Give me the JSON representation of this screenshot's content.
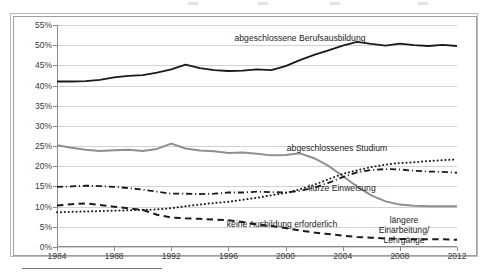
{
  "chart_data": {
    "type": "line",
    "title": "",
    "subtitle": "",
    "xlabel": "",
    "ylabel": "",
    "xlim": [
      1984,
      2012
    ],
    "ylim": [
      0,
      55
    ],
    "ytick_labels": [
      "0%",
      "5%",
      "10%",
      "15%",
      "20%",
      "25%",
      "30%",
      "35%",
      "40%",
      "45%",
      "50%",
      "55%"
    ],
    "ytick_values": [
      0,
      5,
      10,
      15,
      20,
      25,
      30,
      35,
      40,
      45,
      50,
      55
    ],
    "xtick_labels": [
      "1984",
      "1988",
      "1992",
      "1996",
      "2000",
      "2004",
      "2008",
      "2012"
    ],
    "xtick_values": [
      1984,
      1988,
      1992,
      1996,
      2000,
      2004,
      2008,
      2012
    ],
    "grid": true,
    "legend_position": "inline-annotations",
    "x": [
      1984,
      1985,
      1986,
      1987,
      1988,
      1989,
      1990,
      1991,
      1992,
      1993,
      1994,
      1995,
      1996,
      1997,
      1998,
      1999,
      2000,
      2001,
      2002,
      2003,
      2004,
      2005,
      2006,
      2007,
      2008,
      2009,
      2010,
      2011,
      2012
    ],
    "series": [
      {
        "name": "abgeschlossene Berufsausbildung",
        "style": "solid",
        "color": "#1a1a1a",
        "width": 1.8,
        "values": [
          41.0,
          41.0,
          41.1,
          41.4,
          42.0,
          42.4,
          42.6,
          43.2,
          44.0,
          45.2,
          44.3,
          43.8,
          43.6,
          43.7,
          44.0,
          43.8,
          44.8,
          46.3,
          47.6,
          48.7,
          49.9,
          50.8,
          50.3,
          49.9,
          50.4,
          50.0,
          49.8,
          50.1,
          49.8
        ]
      },
      {
        "name": "längere Einarbeitung/ Lehrgänge",
        "style": "solid",
        "color": "#8f8f8f",
        "width": 2.0,
        "values": [
          25.2,
          24.6,
          24.1,
          23.8,
          24.0,
          24.1,
          23.8,
          24.3,
          25.6,
          24.4,
          23.9,
          23.7,
          23.3,
          23.4,
          23.1,
          22.7,
          22.8,
          23.2,
          22.0,
          20.1,
          17.6,
          15.0,
          12.8,
          11.3,
          10.5,
          10.2,
          10.1,
          10.1,
          10.1
        ]
      },
      {
        "name": "kurze Einweisung",
        "style": "dashdot",
        "color": "#1a1a1a",
        "width": 1.8,
        "values": [
          14.9,
          15.0,
          15.2,
          15.1,
          14.9,
          14.6,
          14.2,
          13.7,
          13.2,
          13.2,
          13.1,
          13.2,
          13.5,
          13.5,
          13.7,
          13.6,
          13.5,
          13.9,
          14.7,
          15.9,
          17.3,
          18.5,
          19.1,
          19.3,
          19.2,
          18.9,
          18.7,
          18.6,
          18.4
        ]
      },
      {
        "name": "abgeschlossenes Studium",
        "style": "dotted",
        "color": "#1a1a1a",
        "width": 2.0,
        "values": [
          8.6,
          8.7,
          8.8,
          8.9,
          9.0,
          9.1,
          9.2,
          9.3,
          9.6,
          10.1,
          10.5,
          10.9,
          11.2,
          11.7,
          12.2,
          12.8,
          13.4,
          14.3,
          15.4,
          16.8,
          18.1,
          19.0,
          19.8,
          20.4,
          20.8,
          21.0,
          21.3,
          21.5,
          21.7
        ]
      },
      {
        "name": "keine Ausbildung erforderlich",
        "style": "dashed",
        "color": "#1a1a1a",
        "width": 2.0,
        "values": [
          10.3,
          10.6,
          10.8,
          10.4,
          10.0,
          9.6,
          9.2,
          8.0,
          7.3,
          7.1,
          7.0,
          6.8,
          6.6,
          6.2,
          5.6,
          5.2,
          4.7,
          4.1,
          3.6,
          3.2,
          2.8,
          2.5,
          2.3,
          2.1,
          2.0,
          1.9,
          1.9,
          1.9,
          1.8
        ]
      }
    ],
    "annotations": [
      {
        "text": "abgeschlossene Berufsausbildung",
        "x_px": 300,
        "y_px": 33,
        "lines": 1
      },
      {
        "text": "abgeschlossenes Studium",
        "x_px": 337,
        "y_px": 143,
        "lines": 1
      },
      {
        "text": "kurze Einweisung",
        "x_px": 342,
        "y_px": 183,
        "lines": 1
      },
      {
        "text": "keine Ausbildung erforderlich",
        "x_px": 282,
        "y_px": 219,
        "lines": 1
      },
      {
        "text": "längere Einarbeitung/ Lehrgänge",
        "x_px": 404,
        "y_px": 215,
        "lines": 2
      }
    ]
  }
}
